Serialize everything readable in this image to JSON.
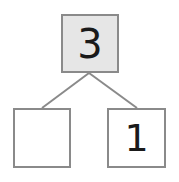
{
  "number_bond": {
    "whole": "3",
    "part_left": "",
    "part_right": "1"
  },
  "colors": {
    "whole_fill": "#e6e6e6",
    "border": "#8a8a8a",
    "line": "#8a8a8a"
  }
}
